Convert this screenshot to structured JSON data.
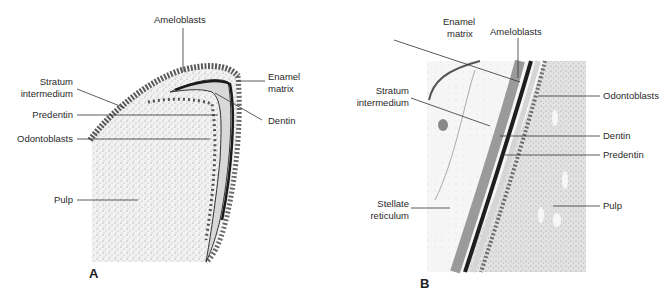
{
  "figure": {
    "panels": [
      {
        "letter": "A",
        "labels": {
          "ameloblasts": "Ameloblasts",
          "enamel_matrix_1": "Enamel",
          "enamel_matrix_2": "matrix",
          "stratum_1": "Stratum",
          "stratum_2": "intermedium",
          "predentin": "Predentin",
          "dentin": "Dentin",
          "odontoblasts": "Odontoblasts",
          "pulp": "Pulp"
        }
      },
      {
        "letter": "B",
        "labels": {
          "enamel_matrix_1": "Enamel",
          "enamel_matrix_2": "matrix",
          "ameloblasts": "Ameloblasts",
          "stratum_1": "Stratum",
          "stratum_2": "intermedium",
          "odontoblasts": "Odontoblasts",
          "dentin": "Dentin",
          "predentin": "Predentin",
          "stellate_1": "Stellate",
          "stellate_2": "reticulum",
          "pulp": "Pulp"
        }
      }
    ]
  }
}
